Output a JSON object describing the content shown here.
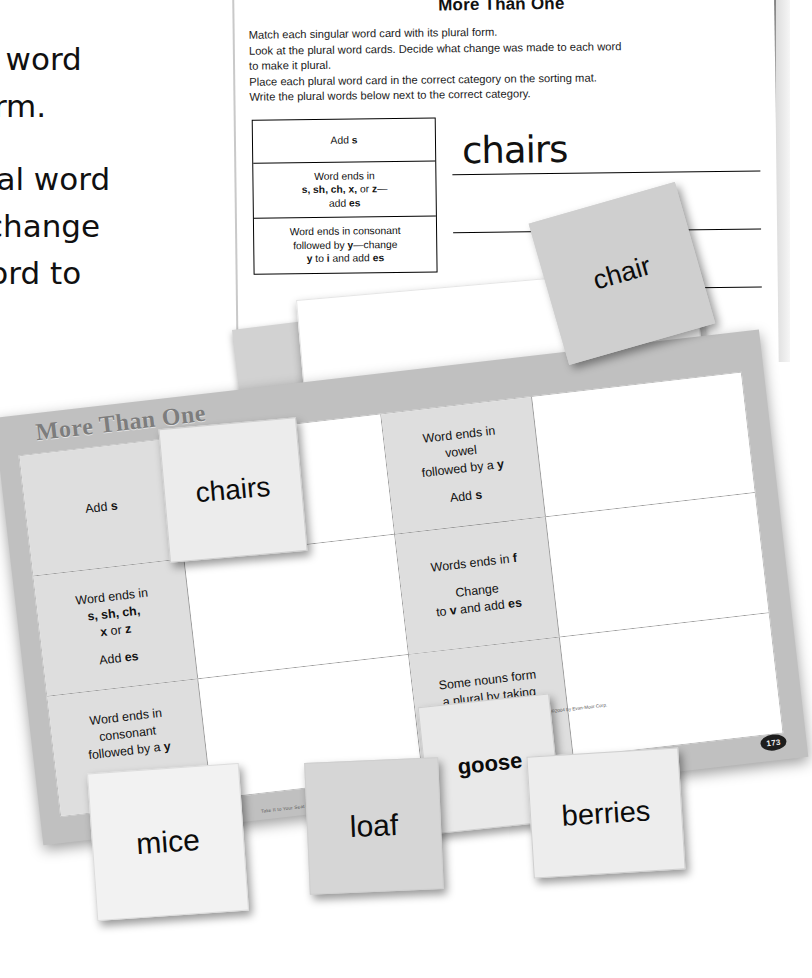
{
  "worksheet": {
    "title": "More Than One",
    "instructions": [
      "Match each singular word card with its plural form.",
      "Look at the plural word cards. Decide what change was made to each word",
      "to make it plural.",
      "Place each plural word card in the correct category on the sorting mat.",
      "Write the plural words below next to the correct category."
    ],
    "categories": [
      "Add s",
      "Word ends in\ns, sh, ch, x, or z—\nadd es",
      "Word ends in consonant\nfollowed by y—change\ny to i and add es"
    ],
    "handwritten_answer": "chairs"
  },
  "sorting_sheet": {
    "label": "Sorting"
  },
  "sorting_mat": {
    "title": "More Than One",
    "page_badge": "173",
    "credit": "Take It to Your Seat • EMC 2759",
    "credit2": "©2004 by Evan-Moor Corp.",
    "left_column": [
      {
        "line1": "Add s"
      },
      {
        "line1": "Word ends in",
        "line2": "s, sh, ch,",
        "line3": "x or z",
        "line4": "Add es"
      },
      {
        "line1": "Word ends in",
        "line2": "consonant",
        "line3": "followed by a y",
        "line4": "to"
      }
    ],
    "right_column": [
      {
        "line1": "Word ends in",
        "line2": "vowel",
        "line3": "followed by a y",
        "line4": "Add s"
      },
      {
        "line1": "Words ends in f",
        "line2": "Change",
        "line3": "to v and add es"
      },
      {
        "line1": "Some nouns form",
        "line2": "a plural by taking",
        "line3": "on an irregular",
        "line4": "spelling"
      }
    ]
  },
  "word_cards": {
    "chairs": "chairs",
    "chair": "chair",
    "goose": "goose",
    "mice": "mice",
    "loaf": "loaf",
    "berries": "berries"
  },
  "overlay_caption": {
    "line1": "ar word",
    "line2": "form.",
    "line3": "ural word",
    "line4": "t change",
    "line5": "word to"
  },
  "colors": {
    "mat_background": "#c0c0c0",
    "cell_fill": "#dedede",
    "card_fill": "#e2e2e2",
    "paper": "#ffffff",
    "ink": "#111111"
  }
}
